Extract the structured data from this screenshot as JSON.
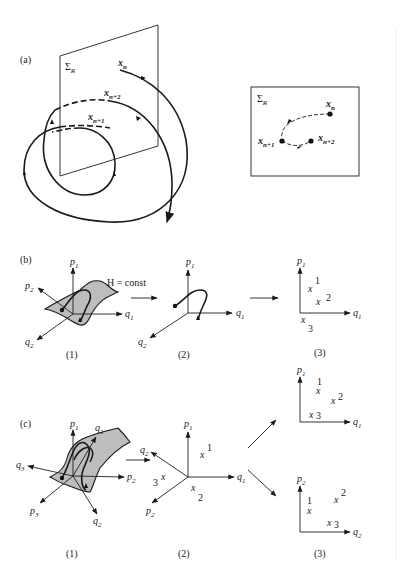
{
  "figure": {
    "panels": {
      "a": {
        "label": "(a)",
        "plane_label": "Σ",
        "plane_sub": "R",
        "orbit_labels": [
          {
            "base": "x",
            "sub": "n"
          },
          {
            "base": "x",
            "sub": "n+2"
          },
          {
            "base": "x",
            "sub": "n+1"
          }
        ],
        "inset": {
          "plane_label": "Σ",
          "plane_sub": "R",
          "points": [
            {
              "base": "x",
              "sub": "n"
            },
            {
              "base": "x",
              "sub": "n+1"
            },
            {
              "base": "x",
              "sub": "n+2"
            }
          ]
        }
      },
      "b": {
        "label": "(b)",
        "arrow_label": "H = const",
        "sub1": {
          "caption": "(1)",
          "axes": [
            {
              "base": "p",
              "sub": "1"
            },
            {
              "base": "p",
              "sub": "2"
            },
            {
              "base": "q",
              "sub": "1"
            },
            {
              "base": "q",
              "sub": "2"
            }
          ]
        },
        "sub2": {
          "caption": "(2)",
          "axes": [
            {
              "base": "p",
              "sub": "1"
            },
            {
              "base": "q",
              "sub": "1"
            },
            {
              "base": "q",
              "sub": "2"
            }
          ]
        },
        "sub3": {
          "caption": "(3)",
          "axes": [
            {
              "base": "p",
              "sub": "1"
            },
            {
              "base": "q",
              "sub": "1"
            }
          ],
          "points": [
            {
              "mark": "x",
              "index": "1"
            },
            {
              "mark": "x",
              "index": "2"
            },
            {
              "mark": "x",
              "index": "3"
            }
          ]
        }
      },
      "c": {
        "label": "(c)",
        "sub1": {
          "caption": "(1)",
          "axes": [
            {
              "base": "p",
              "sub": "1"
            },
            {
              "base": "q",
              "sub": "1"
            },
            {
              "base": "q",
              "sub": "3"
            },
            {
              "base": "p",
              "sub": "2"
            },
            {
              "base": "p",
              "sub": "3"
            },
            {
              "base": "q",
              "sub": "2"
            }
          ]
        },
        "sub2": {
          "caption": "(2)",
          "axes": [
            {
              "base": "p",
              "sub": "1"
            },
            {
              "base": "q",
              "sub": "2"
            },
            {
              "base": "q",
              "sub": "1"
            },
            {
              "base": "p",
              "sub": "2"
            }
          ],
          "points": [
            {
              "mark": "x",
              "index": "1"
            },
            {
              "mark": "x",
              "index": "2"
            },
            {
              "mark": "x",
              "index": "3"
            }
          ]
        },
        "sub3_top": {
          "axes": [
            {
              "base": "p",
              "sub": "1"
            },
            {
              "base": "q",
              "sub": "1"
            }
          ],
          "points": [
            {
              "mark": "x",
              "index": "1"
            },
            {
              "mark": "x",
              "index": "2"
            },
            {
              "mark": "x",
              "index": "3"
            }
          ]
        },
        "sub3_bottom": {
          "caption": "(3)",
          "axes": [
            {
              "base": "p",
              "sub": "2"
            },
            {
              "base": "q",
              "sub": "2"
            }
          ],
          "points": [
            {
              "mark": "x",
              "index": "1"
            },
            {
              "mark": "x",
              "index": "2"
            },
            {
              "mark": "x",
              "index": "3"
            }
          ]
        }
      }
    }
  }
}
